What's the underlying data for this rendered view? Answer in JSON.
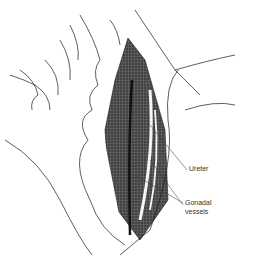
{
  "figure": {
    "labels": [
      {
        "id": "ureter",
        "text": "Ureter",
        "x": 189,
        "y": 168
      },
      {
        "id": "gonadal-1",
        "text": "Gonadal",
        "x": 185,
        "y": 201
      },
      {
        "id": "gonadal-2",
        "text": "vessels",
        "x": 185,
        "y": 210
      }
    ],
    "colors": {
      "ink": "#1a1a1a",
      "shading": "#3a3a3a",
      "paper": "#ffffff"
    }
  }
}
